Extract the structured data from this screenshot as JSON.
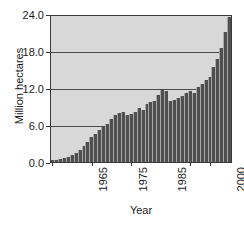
{
  "chart_data": {
    "type": "bar",
    "title": "",
    "xlabel": "Year",
    "ylabel": "Million hectares",
    "ylim": [
      0.0,
      24.0
    ],
    "yticks": [
      "0.0",
      "6.0",
      "12.0",
      "18.0",
      "24.0"
    ],
    "ytick_values": [
      0.0,
      6.0,
      12.0,
      18.0,
      24.0
    ],
    "xticks": [
      "1965",
      "1975",
      "1985",
      "2000",
      "2005"
    ],
    "xtick_values": [
      1965,
      1975,
      1985,
      2000,
      2005
    ],
    "xlim": [
      1964,
      2006
    ],
    "grid": "horizontal",
    "legend": "none",
    "bar_color": "#4f4f4f",
    "plot_background": "#d8d8d8",
    "axis_color": "#3a3a3a",
    "categories": [
      "1965",
      "1966",
      "1967",
      "1968",
      "1969",
      "1970",
      "1971",
      "1972",
      "1973",
      "1974",
      "1975",
      "1976",
      "1977",
      "1978",
      "1979",
      "1980",
      "1981",
      "1982",
      "1983",
      "1984",
      "1985",
      "1986",
      "1987",
      "1988",
      "1989",
      "1990",
      "1991",
      "1992",
      "1993",
      "1994",
      "1995",
      "1996",
      "1997",
      "1998",
      "1999",
      "2000",
      "2001",
      "2002",
      "2003",
      "2004",
      "2005"
    ],
    "values": [
      0.3,
      0.4,
      0.5,
      0.6,
      0.8,
      1.1,
      1.5,
      2.0,
      2.6,
      3.3,
      4.1,
      4.6,
      5.2,
      5.7,
      6.3,
      7.1,
      7.7,
      8.0,
      8.2,
      7.8,
      7.9,
      8.3,
      8.8,
      8.6,
      9.5,
      9.8,
      10.0,
      11.0,
      11.9,
      11.6,
      10.1,
      10.2,
      10.5,
      10.8,
      11.4,
      11.7,
      11.3,
      12.3,
      12.9,
      13.4,
      14.0
    ],
    "trailing_values": [
      15.6,
      16.9,
      18.7,
      21.3,
      23.8
    ],
    "peak_value": 23.8
  },
  "caption": {
    "text": ""
  }
}
